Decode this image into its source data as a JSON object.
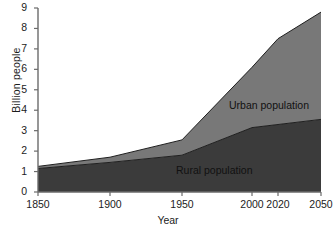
{
  "chart_data": {
    "type": "area",
    "title": "",
    "subtitle": "",
    "xlabel": "Year",
    "ylabel": "Billion people",
    "stacked": true,
    "grid": false,
    "legend_position": "inline-annotation",
    "x": [
      1850,
      1900,
      1950,
      2000,
      2020,
      2050
    ],
    "xtick_labels": [
      "1850",
      "1900",
      "1950",
      "2000",
      "2020",
      "2050"
    ],
    "xtick_positions_px": [
      38,
      110,
      182,
      252,
      278,
      321
    ],
    "xlim": [
      1850,
      2050
    ],
    "ytick_labels": [
      "0",
      "1",
      "2",
      "3",
      "4",
      "5",
      "6",
      "7",
      "8",
      "9"
    ],
    "yticks": [
      0,
      1,
      2,
      3,
      4,
      5,
      6,
      7,
      8,
      9
    ],
    "ylim": [
      0,
      9
    ],
    "series": [
      {
        "name": "Rural population",
        "color": "#3b3b3b",
        "values": [
          1.15,
          1.45,
          1.8,
          3.15,
          3.3,
          3.55
        ]
      },
      {
        "name": "Urban population",
        "color": "#787878",
        "values": [
          0.1,
          0.25,
          0.75,
          2.95,
          4.2,
          5.25
        ]
      }
    ],
    "totals": [
      1.25,
      1.7,
      2.55,
      6.1,
      7.5,
      8.8
    ],
    "annotations": [
      {
        "name": "urban-population-label",
        "text": "Urban population",
        "x_px": 229,
        "y_px": 99
      },
      {
        "name": "rural-population-label",
        "text": "Rural population",
        "x_px": 176,
        "y_px": 164
      }
    ]
  },
  "colors": {
    "rural": "#3b3b3b",
    "urban": "#787878",
    "axis": "#6b6b6b",
    "text": "#1c1c1c",
    "background": "#ffffff"
  }
}
